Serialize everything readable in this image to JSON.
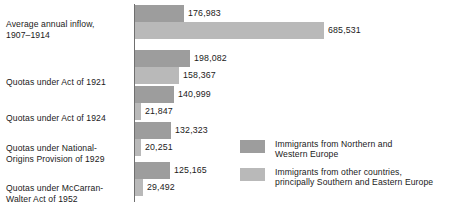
{
  "chart_data": {
    "type": "bar",
    "orientation": "horizontal",
    "title": "",
    "xlabel": "",
    "ylabel": "",
    "grid": false,
    "legend_position": "middle-right",
    "xlim": [
      0,
      685531
    ],
    "categories": [
      "Average annual inflow, 1907–1914",
      "Quotas under Act of 1921",
      "Quotas under Act of 1924",
      "Quotas under National-Origins Provision of 1929",
      "Quotas under McCarran-Walter Act of 1952"
    ],
    "category_lines": [
      [
        "Average annual inflow,",
        "1907–1914"
      ],
      [
        "Quotas under Act of 1921"
      ],
      [
        "Quotas under Act of 1924"
      ],
      [
        "Quotas under National-",
        "Origins Provision of 1929"
      ],
      [
        "Quotas under McCarran-",
        "Walter Act of 1952"
      ]
    ],
    "series": [
      {
        "name": "Immigrants from Northern and Western Europe",
        "name_lines": [
          "Immigrants from Northern and",
          "Western Europe"
        ],
        "color": "#9d9d9d",
        "values": [
          176983,
          198082,
          140999,
          132323,
          125165
        ],
        "value_labels": [
          "176,983",
          "198,082",
          "140,999",
          "132,323",
          "125,165"
        ]
      },
      {
        "name": "Immigrants from other countries, principally Southern and Eastern Europe",
        "name_lines": [
          "Immigrants from other countries,",
          "principally Southern and Eastern Europe"
        ],
        "color": "#b9b9b9",
        "values": [
          685531,
          158367,
          21847,
          20251,
          29492
        ],
        "value_labels": [
          "685,531",
          "158,367",
          "21,847",
          "20,251",
          "29,492"
        ]
      }
    ]
  },
  "axis": {
    "color": "#6f6f6f"
  },
  "colors": {
    "series1": "#9d9d9d",
    "series2": "#b9b9b9",
    "text": "#1a1a1a",
    "background": "#ffffff"
  }
}
